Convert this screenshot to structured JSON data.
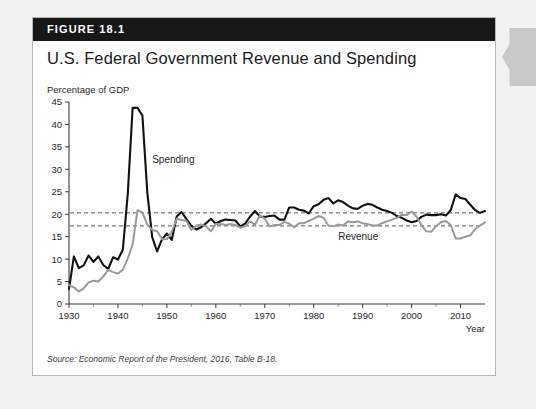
{
  "figure": {
    "number_label": "FIGURE 18.1",
    "title": "U.S. Federal Government Revenue and Spending",
    "source": "Source: Economic Report of the President, 2016, Table B-18."
  },
  "colors": {
    "header_bar": "#171717",
    "spending_line": "#111111",
    "revenue_line": "#9a9a9a",
    "reference_line": "#555555",
    "card_background": "#ffffff",
    "page_background": "#f2f2f0",
    "edge_tab": "#c9c9c6"
  },
  "chart_data": {
    "type": "line",
    "title": "U.S. Federal Government Revenue and Spending",
    "xlabel": "Year",
    "ylabel": "Percentage of GDP",
    "ylim": [
      0,
      45
    ],
    "xlim": [
      1930,
      2015
    ],
    "ytick_step": 5,
    "yticks": [
      0,
      5,
      10,
      15,
      20,
      25,
      30,
      35,
      40,
      45
    ],
    "xticks": [
      1930,
      1940,
      1950,
      1960,
      1970,
      1980,
      1990,
      2000,
      2010
    ],
    "grid": false,
    "legend_position": "inline-annotation",
    "annotations": [
      {
        "text": "Spending",
        "x": 1947,
        "y": 31.5
      },
      {
        "text": "Revenue",
        "x": 1985,
        "y": 14.3
      }
    ],
    "reference_lines": [
      {
        "name": "average-spending",
        "value": 20.3,
        "style": "dashed"
      },
      {
        "name": "average-revenue",
        "value": 17.4,
        "style": "dashed"
      }
    ],
    "x": [
      1930,
      1931,
      1932,
      1933,
      1934,
      1935,
      1936,
      1937,
      1938,
      1939,
      1940,
      1941,
      1942,
      1943,
      1944,
      1945,
      1946,
      1947,
      1948,
      1949,
      1950,
      1951,
      1952,
      1953,
      1954,
      1955,
      1956,
      1957,
      1958,
      1959,
      1960,
      1961,
      1962,
      1963,
      1964,
      1965,
      1966,
      1967,
      1968,
      1969,
      1970,
      1971,
      1972,
      1973,
      1974,
      1975,
      1976,
      1977,
      1978,
      1979,
      1980,
      1981,
      1982,
      1983,
      1984,
      1985,
      1986,
      1987,
      1988,
      1989,
      1990,
      1991,
      1992,
      1993,
      1994,
      1995,
      1996,
      1997,
      1998,
      1999,
      2000,
      2001,
      2002,
      2003,
      2004,
      2005,
      2006,
      2007,
      2008,
      2009,
      2010,
      2011,
      2012,
      2013,
      2014,
      2015
    ],
    "series": [
      {
        "name": "Spending",
        "color": "#111111",
        "values": [
          3.4,
          10.6,
          8.0,
          8.6,
          10.8,
          9.4,
          10.6,
          8.7,
          7.8,
          10.4,
          9.9,
          12.1,
          24.4,
          43.7,
          43.7,
          42.0,
          24.8,
          14.9,
          11.7,
          14.4,
          15.7,
          14.3,
          19.5,
          20.5,
          18.9,
          17.4,
          16.6,
          17.1,
          18.0,
          19.0,
          17.9,
          18.5,
          18.8,
          18.7,
          18.6,
          17.3,
          17.9,
          19.5,
          20.7,
          19.5,
          19.4,
          19.6,
          19.7,
          18.8,
          18.8,
          21.5,
          21.5,
          21.0,
          20.8,
          20.2,
          21.8,
          22.2,
          23.2,
          23.6,
          22.4,
          23.1,
          22.7,
          21.9,
          21.3,
          21.2,
          21.9,
          22.3,
          22.1,
          21.5,
          21.0,
          20.7,
          20.3,
          19.6,
          19.2,
          18.6,
          18.2,
          18.5,
          19.4,
          19.9,
          19.8,
          19.8,
          20.0,
          19.7,
          20.9,
          24.4,
          23.6,
          23.4,
          22.1,
          20.9,
          20.3,
          20.7
        ]
      },
      {
        "name": "Revenue",
        "color": "#9a9a9a",
        "values": [
          4.2,
          3.7,
          2.8,
          3.5,
          4.8,
          5.2,
          5.0,
          6.1,
          7.6,
          7.1,
          6.8,
          7.6,
          10.1,
          13.3,
          20.9,
          20.4,
          17.7,
          16.5,
          16.2,
          14.5,
          14.4,
          16.1,
          19.0,
          18.7,
          18.5,
          16.5,
          17.5,
          17.7,
          17.3,
          16.2,
          17.8,
          17.8,
          17.6,
          17.8,
          17.6,
          17.0,
          17.3,
          18.4,
          17.6,
          19.7,
          19.0,
          17.3,
          17.6,
          17.6,
          18.3,
          17.9,
          17.1,
          18.0,
          18.0,
          18.5,
          19.0,
          19.6,
          19.2,
          17.5,
          17.3,
          17.7,
          17.5,
          18.4,
          18.2,
          18.4,
          18.0,
          17.8,
          17.5,
          17.5,
          18.0,
          18.4,
          18.8,
          19.2,
          19.9,
          19.8,
          20.6,
          19.5,
          17.6,
          16.2,
          16.1,
          17.3,
          18.2,
          18.5,
          17.6,
          14.6,
          14.6,
          15.0,
          15.3,
          16.7,
          17.5,
          18.2
        ]
      }
    ]
  }
}
